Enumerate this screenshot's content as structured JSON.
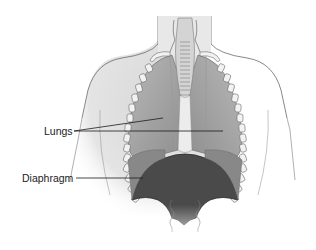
{
  "figure": {
    "labels": [
      {
        "id": "lungs",
        "text": "Lungs",
        "leader_targets": 2
      },
      {
        "id": "diaphragm",
        "text": "Diaphragm",
        "leader_targets": 1
      }
    ],
    "colors": {
      "background": "#ffffff",
      "skin_fill": "#e6e6e6",
      "outline": "#6a6a6a",
      "lung_fill": "#9c9c9c",
      "diaphragm_fill": "#4a4a4a",
      "rib_fill": "#f2f2f2",
      "label_text": "#222222",
      "leader_line": "#1a1a1a"
    }
  }
}
